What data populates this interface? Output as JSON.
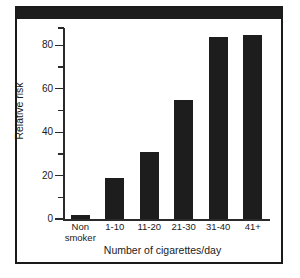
{
  "chart_data": {
    "type": "bar",
    "title": "",
    "xlabel": "Number of cigarettes/day",
    "ylabel": "Relative risk",
    "categories": [
      "Non smoker",
      "1-10",
      "11-20",
      "21-30",
      "31-40",
      "41+"
    ],
    "category_lines": [
      [
        "Non",
        "smoker"
      ],
      [
        "1-10"
      ],
      [
        "11-20"
      ],
      [
        "21-30"
      ],
      [
        "31-40"
      ],
      [
        "41+"
      ]
    ],
    "values": [
      2,
      19,
      31,
      55,
      84,
      85
    ],
    "ylim": [
      0,
      88
    ],
    "ytick_major": [
      0,
      20,
      40,
      60,
      80
    ],
    "ytick_major_labels": [
      "0",
      "20",
      "40",
      "60",
      "80"
    ],
    "ytick_minor": [
      10,
      30,
      50,
      70,
      88
    ],
    "grid": false,
    "legend": false,
    "bar_color": "#1d1d1d",
    "axis_color": "#2a2a2a",
    "background": "#ffffff"
  },
  "figure": {
    "frame_color": "#1a1a1a",
    "top_bar_color": "#1d1d1d"
  }
}
